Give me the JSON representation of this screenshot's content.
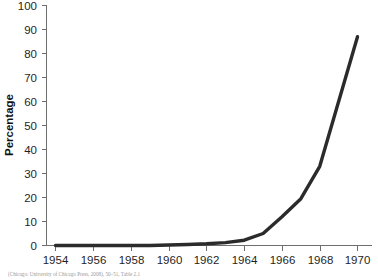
{
  "chart_data": {
    "type": "line",
    "title": "",
    "xlabel": "",
    "ylabel": "Percentage",
    "xlim": [
      1954,
      1970
    ],
    "ylim": [
      0,
      100
    ],
    "grid": false,
    "legend": null,
    "x_ticks": [
      "1954",
      "1956",
      "1958",
      "1960",
      "1962",
      "1964",
      "1966",
      "1968",
      "1970"
    ],
    "y_ticks": [
      "0",
      "10",
      "20",
      "30",
      "40",
      "50",
      "60",
      "70",
      "80",
      "90",
      "100"
    ],
    "x": [
      1954,
      1955,
      1956,
      1957,
      1958,
      1959,
      1960,
      1961,
      1962,
      1963,
      1964,
      1965,
      1966,
      1967,
      1968,
      1969,
      1970
    ],
    "values": [
      0,
      0,
      0,
      0,
      0,
      0,
      0.2,
      0.4,
      0.7,
      1.2,
      2.2,
      5.0,
      12.0,
      19.5,
      33.0,
      60.0,
      87.0
    ],
    "series": [
      {
        "name": "Percentage",
        "color": "#2b2b2b",
        "values": [
          0,
          0,
          0,
          0,
          0,
          0,
          0.2,
          0.4,
          0.7,
          1.2,
          2.2,
          5.0,
          12.0,
          19.5,
          33.0,
          60.0,
          87.0
        ]
      }
    ]
  },
  "caption": {
    "text": "(Chicago: University of Chicago Press, 2008), 50–51, Table 2.1"
  },
  "colors": {
    "line": "#2b2b2b",
    "axis": "#6e6e6e",
    "text": "#1f1f1f",
    "background": "#ffffff"
  }
}
